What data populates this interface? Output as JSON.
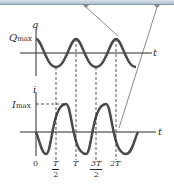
{
  "diagram": {
    "top_panel": {
      "axis_label_y": "q",
      "axis_label_x": "t",
      "amplitude_label": "Q",
      "amplitude_sub": "max",
      "waveform": "cosine"
    },
    "bottom_panel": {
      "axis_label_y": "i",
      "axis_label_x": "t",
      "amplitude_label": "I",
      "amplitude_sub": "max",
      "waveform": "negative sine"
    },
    "time_ticks": [
      {
        "label": "0"
      },
      {
        "num": "T",
        "den": "2"
      },
      {
        "label": "T"
      },
      {
        "num": "3T",
        "den": "2"
      },
      {
        "label": "2T"
      }
    ],
    "colors": {
      "curve": "#4a4a4a",
      "axis": "#2a2a2a",
      "pointer_lines": "#8a8a8a",
      "top_bar": "#c4d2de"
    }
  }
}
